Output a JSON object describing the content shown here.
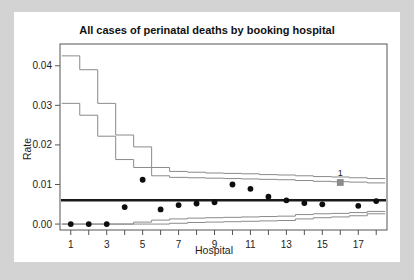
{
  "figure": {
    "background_color": "#d3d3d3",
    "card_color": "#ffffff",
    "title": "All cases of perinatal deaths by booking hospital"
  },
  "chart_data": {
    "type": "scatter",
    "title": "All cases of perinatal deaths by booking hospital",
    "xlabel": "Hospital",
    "ylabel": "Rate",
    "xlim": [
      0.4,
      18.6
    ],
    "ylim": [
      -0.0015,
      0.0455
    ],
    "grid": false,
    "legend": null,
    "x_ticks": [
      1,
      3,
      5,
      7,
      9,
      11,
      13,
      15,
      17
    ],
    "x_tick_labels": [
      "1",
      "3",
      "5",
      "7",
      "9",
      "11",
      "13",
      "15",
      "17"
    ],
    "x_minor_ticks": [
      2,
      4,
      6,
      8,
      10,
      12,
      14,
      16,
      18
    ],
    "y_ticks": [
      0.0,
      0.01,
      0.02,
      0.03,
      0.04
    ],
    "y_tick_labels": [
      "0.00",
      "0.01",
      "0.02",
      "0.03",
      "0.04"
    ],
    "target_value": 0.006,
    "target_color": "#1a1a1a",
    "limit_color": "#8a8a8a",
    "point_color": "#0d0d0d",
    "x": [
      1,
      2,
      3,
      4,
      5,
      6,
      7,
      8,
      9,
      10,
      11,
      12,
      13,
      14,
      15,
      16,
      17,
      18
    ],
    "categories": [
      "1",
      "2",
      "3",
      "4",
      "5",
      "6",
      "7",
      "8",
      "9",
      "10",
      "11",
      "12",
      "13",
      "14",
      "15",
      "16",
      "17",
      "18"
    ],
    "values": [
      0.0,
      0.0,
      0.0,
      0.0043,
      0.0112,
      0.0037,
      0.0048,
      0.0052,
      0.0055,
      0.01,
      0.0089,
      0.0069,
      0.006,
      0.0053,
      0.005,
      0.0105,
      0.0046,
      0.0058
    ],
    "highlighted_points": [
      {
        "x": 16,
        "y": 0.0105,
        "label": "1",
        "marker": "square",
        "color": "#8c8c8c"
      }
    ],
    "series": [
      {
        "name": "observed rate",
        "type": "scatter",
        "marker": "circle",
        "color": "#0d0d0d",
        "values": [
          0.0,
          0.0,
          0.0,
          0.0043,
          0.0112,
          0.0037,
          0.0048,
          0.0052,
          0.0055,
          0.01,
          0.0089,
          0.0069,
          0.006,
          0.0053,
          0.005,
          0.0105,
          0.0046,
          0.0058
        ]
      },
      {
        "name": "upper outer limit",
        "type": "step",
        "color": "#8a8a8a",
        "values": [
          0.0425,
          0.039,
          0.0305,
          0.0225,
          0.0195,
          0.0143,
          0.0133,
          0.0131,
          0.0129,
          0.0128,
          0.0127,
          0.0125,
          0.0124,
          0.0122,
          0.012,
          0.0119,
          0.0117,
          0.0115
        ]
      },
      {
        "name": "upper inner limit",
        "type": "step",
        "color": "#8a8a8a",
        "values": [
          0.0305,
          0.0275,
          0.0222,
          0.0163,
          0.0143,
          0.0122,
          0.0118,
          0.0117,
          0.0116,
          0.0115,
          0.0114,
          0.0113,
          0.0112,
          0.011,
          0.0108,
          0.0107,
          0.0106,
          0.0104
        ],
        "note": "second gray band drops a step lower at hospital 18"
      },
      {
        "name": "lower inner limit",
        "type": "step",
        "color": "#8a8a8a",
        "values": [
          0.0,
          0.0,
          0.0,
          0.0,
          0.0005,
          0.001,
          0.0013,
          0.0015,
          0.0016,
          0.0017,
          0.0018,
          0.0019,
          0.002,
          0.0024,
          0.0026,
          0.0027,
          0.0029,
          0.0032
        ]
      },
      {
        "name": "lower outer limit",
        "type": "step",
        "color": "#8a8a8a",
        "values": [
          0.0,
          0.0,
          0.0,
          0.0,
          0.0,
          0.0,
          0.0002,
          0.0004,
          0.0005,
          0.0006,
          0.0007,
          0.0008,
          0.0009,
          0.0013,
          0.0016,
          0.0018,
          0.0021,
          0.0026
        ]
      },
      {
        "name": "target / overall rate",
        "type": "hline",
        "color": "#1a1a1a",
        "value": 0.006
      }
    ]
  }
}
